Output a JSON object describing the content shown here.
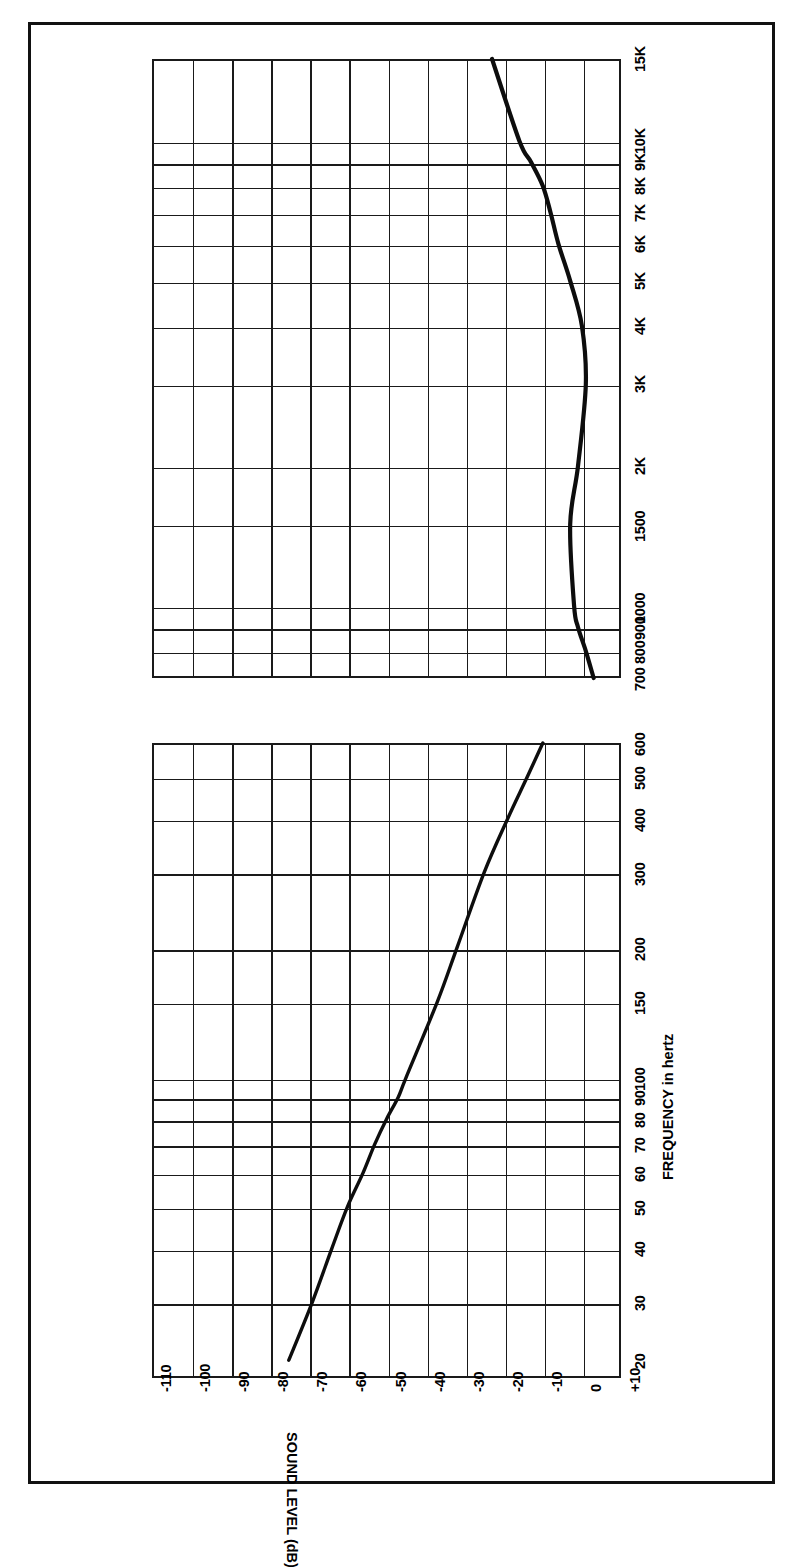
{
  "document": {
    "kind": "speaker-frequency-response-chart-page",
    "orientation": "rotated-90-ccw"
  },
  "axes": {
    "x_axis_title": "FREQUENCY in hertz",
    "y_axis_title": "SOUND LEVEL (dB)"
  },
  "chart_data": [
    {
      "type": "line",
      "id": "low-frequency-response",
      "title": "",
      "xlabel": "FREQUENCY in hertz",
      "ylabel": "SOUND LEVEL (dB)",
      "xscale": "log",
      "grid": true,
      "legend": "none",
      "tick_labels_x": [
        "20",
        "30",
        "40",
        "50",
        "60",
        "70",
        "80",
        "90",
        "100",
        "150",
        "200",
        "300",
        "400",
        "500",
        "600"
      ],
      "tick_labels_y": [
        "-110",
        "-100",
        "-90",
        "-80",
        "-70",
        "-60",
        "-50",
        "-40",
        "-30",
        "-20",
        "-10",
        "0",
        "+10"
      ],
      "xlim": [
        20,
        600
      ],
      "ylim": [
        -110,
        10
      ],
      "x": [
        22,
        30,
        40,
        50,
        60,
        70,
        80,
        90,
        100,
        150,
        200,
        300,
        400,
        500,
        600
      ],
      "y": [
        -75,
        -69,
        -64,
        -60,
        -56,
        -53,
        -50,
        -47,
        -45,
        -37,
        -32,
        -25,
        -19,
        -14,
        -10
      ],
      "series_name": "Sound level"
    },
    {
      "type": "line",
      "id": "high-frequency-response",
      "title": "",
      "xlabel": "FREQUENCY in hertz",
      "ylabel": "SOUND LEVEL (dB)",
      "xscale": "log",
      "grid": true,
      "legend": "none",
      "tick_labels_x": [
        "700",
        "800",
        "900",
        "1000",
        "1500",
        "2K",
        "3K",
        "4K",
        "5K",
        "6K",
        "7K",
        "8K",
        "9K",
        "10K",
        "15K"
      ],
      "tick_labels_y": [
        "-110",
        "-100",
        "-90",
        "-80",
        "-70",
        "-60",
        "-50",
        "-40",
        "-30",
        "-20",
        "-10",
        "0",
        "+10"
      ],
      "xlim": [
        700,
        15000
      ],
      "ylim": [
        -110,
        10
      ],
      "x": [
        700,
        800,
        900,
        1000,
        1500,
        2000,
        3000,
        4000,
        5000,
        6000,
        7000,
        8000,
        9000,
        10000,
        15000
      ],
      "y": [
        3,
        1,
        -1,
        -2,
        -3,
        -1,
        1,
        0,
        -3,
        -6,
        -8,
        -10,
        -13,
        -16,
        -23
      ],
      "series_name": "Sound level"
    }
  ],
  "colors": {
    "ink": "#111111",
    "paper": "#ffffff",
    "grid": "#1a1a1a"
  }
}
